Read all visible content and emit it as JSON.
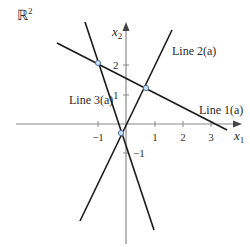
{
  "figure": {
    "space_label": "ℝ",
    "space_exp": "2",
    "axes": {
      "x_label": "x",
      "x_sub": "1",
      "y_label": "x",
      "y_sub": "2",
      "x_ticks": [
        {
          "value": -1,
          "label": "−1",
          "px": 98
        },
        {
          "value": 1,
          "label": "1",
          "px": 155
        },
        {
          "value": 2,
          "label": "2",
          "px": 183
        },
        {
          "value": 3,
          "label": "3",
          "px": 211
        }
      ],
      "y_ticks": [
        {
          "value": 2,
          "label": "2",
          "py": 65
        },
        {
          "value": 1,
          "label": "1",
          "py": 95
        },
        {
          "value": -1,
          "label": "−1",
          "py": 153
        }
      ]
    },
    "lines": [
      {
        "name": "Line 1(a)",
        "label": "Line 1(a)",
        "x1": 57,
        "y1": 43,
        "x2": 227,
        "y2": 130
      },
      {
        "name": "Line 2(a)",
        "label": "Line 2(a)",
        "x1": 80,
        "y1": 221,
        "x2": 172,
        "y2": 30
      },
      {
        "name": "Line 3(a)",
        "label": "Line 3(a)",
        "x1": 85,
        "y1": 22,
        "x2": 154,
        "y2": 230
      }
    ],
    "intersections": [
      {
        "lines": [
          "Line 1(a)",
          "Line 3(a)"
        ],
        "px": 98,
        "py": 63
      },
      {
        "lines": [
          "Line 1(a)",
          "Line 2(a)"
        ],
        "px": 146,
        "py": 88
      },
      {
        "lines": [
          "Line 2(a)",
          "Line 3(a)"
        ],
        "px": 121,
        "py": 133
      }
    ],
    "colors": {
      "line": "#1a1a1a",
      "axis": "#8a8a8a",
      "point": "#4a6fa5"
    }
  }
}
